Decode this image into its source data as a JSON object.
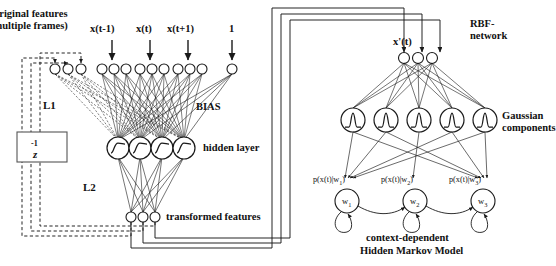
{
  "diagram": {
    "labels": {
      "original_features_line1": "original features",
      "original_features_line2": "(multiple frames)",
      "input_xtm1": "x(t-1)",
      "input_xt": "x(t)",
      "input_xtp1": "x(t+1)",
      "input_one": "1",
      "bias": "BIAS",
      "l1": "L1",
      "l2": "L2",
      "hidden_layer": "hidden layer",
      "transformed_features": "transformed features",
      "delay_z": "z",
      "delay_exp": "-1",
      "rbf_line1": "RBF-",
      "rbf_line2": "network",
      "xprime_t": "x'(t)",
      "gaussian_line1": "Gaussian",
      "gaussian_line2": "components",
      "hmm_line1": "context-dependent",
      "hmm_line2": "Hidden Markov Model"
    },
    "hmm": {
      "emissions": [
        {
          "prefix": "p(x(t)|w",
          "sub": "1",
          "suffix": ")"
        },
        {
          "prefix": "p(x(t)|w",
          "sub": "2",
          "suffix": ")"
        },
        {
          "prefix": "p(x(t)|w",
          "sub": "3",
          "suffix": ")"
        }
      ],
      "states": [
        {
          "name": "w",
          "sub": "1"
        },
        {
          "name": "w",
          "sub": "2"
        },
        {
          "name": "w",
          "sub": "3"
        }
      ]
    },
    "counts": {
      "recurrent_input_nodes": 3,
      "frame_nodes_per_group": 3,
      "frame_groups": 3,
      "bias_nodes": 1,
      "hidden_nodes": 4,
      "transformed_feature_nodes": 3,
      "xprime_nodes": 3,
      "gaussian_components": 5,
      "hmm_states": 3
    },
    "colors": {
      "stroke": "#1a1a1a",
      "dashed_stroke": "#1a1a1a",
      "background": "#ffffff",
      "text": "#111111"
    }
  }
}
